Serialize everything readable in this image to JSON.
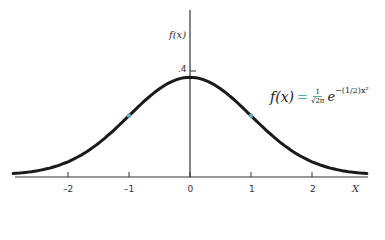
{
  "chart_data": {
    "type": "line",
    "title": "",
    "xlabel": "X",
    "ylabel": "f(x)",
    "formula": "f(x) = (1/√(2π)) e^{-(1/2)x²}",
    "x_ticks": [
      -2,
      -1,
      0,
      1,
      2
    ],
    "x_tick_labels": [
      "–2",
      "–1",
      "0",
      "1",
      "2"
    ],
    "y_ticks": [
      0.4
    ],
    "y_tick_labels": [
      ".4"
    ],
    "xlim": [
      -2.9,
      2.9
    ],
    "ylim": [
      0,
      0.45
    ],
    "grid": false,
    "legend": null,
    "series": [
      {
        "name": "Standard normal density",
        "x": [
          -2.9,
          -2.5,
          -2.0,
          -1.5,
          -1.0,
          -0.5,
          0.0,
          0.5,
          1.0,
          1.5,
          2.0,
          2.5,
          2.9
        ],
        "values": [
          0.006,
          0.018,
          0.054,
          0.13,
          0.242,
          0.352,
          0.399,
          0.352,
          0.242,
          0.13,
          0.054,
          0.018,
          0.006
        ]
      }
    ],
    "annotations": [
      {
        "text": "inflection point",
        "x": -1,
        "marker": "teal dot"
      },
      {
        "text": "inflection point",
        "x": 1,
        "marker": "teal dot"
      }
    ],
    "colors": {
      "curve": "#1a1a1a",
      "axis": "#333333",
      "accent": "#5fa8b8"
    }
  },
  "labels": {
    "y_axis": "f(x)",
    "x_axis": "X",
    "peak": ".4",
    "formula_lhs": "f(x)",
    "formula_eq": "=",
    "formula_num": "1",
    "formula_den": "√2π",
    "formula_base": "e",
    "formula_exp": "−(1/2)x²"
  }
}
